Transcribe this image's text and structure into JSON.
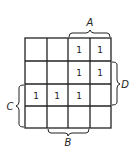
{
  "diagram": {
    "type": "karnaugh-map",
    "rows": 4,
    "cols": 4,
    "cells": [
      [
        "",
        "",
        "1",
        "1"
      ],
      [
        "",
        "",
        "1",
        "1"
      ],
      [
        "1",
        "1",
        "1",
        ""
      ],
      [
        "",
        "",
        "",
        ""
      ]
    ],
    "braces": {
      "A": {
        "label": "A",
        "side": "top",
        "span_cols": [
          2,
          3
        ]
      },
      "B": {
        "label": "B",
        "side": "bottom",
        "span_cols": [
          1,
          2
        ]
      },
      "C": {
        "label": "C",
        "side": "left",
        "span_rows": [
          2,
          3
        ]
      },
      "D": {
        "label": "D",
        "side": "right",
        "span_rows": [
          1,
          2
        ]
      }
    },
    "line_color": "#222222"
  }
}
